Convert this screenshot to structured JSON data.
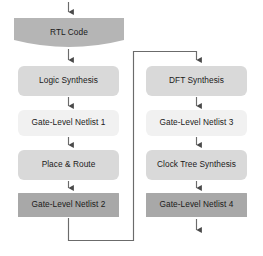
{
  "diagram": {
    "background_color": "#ffffff",
    "line_color": "#595959",
    "text_color": "#1a1a1a",
    "colors": {
      "banner_gray": "#b5b5b5",
      "mid_gray": "#d7d7d7",
      "light_gray": "#efefef",
      "dark_gray": "#a8a8a8"
    },
    "nodes": [
      {
        "id": "rtl-code",
        "label": "RTL Code",
        "shape": "banner",
        "fill": "#b5b5b5",
        "x": 14,
        "y": 18,
        "w": 110,
        "h": 29
      },
      {
        "id": "logic-synthesis",
        "label": "Logic Synthesis",
        "shape": "rounded",
        "fill": "#d9d9d9",
        "x": 18,
        "y": 66,
        "w": 101,
        "h": 30
      },
      {
        "id": "gate-level-netlist-1",
        "label": "Gate-Level Netlist 1",
        "shape": "rounded",
        "fill": "#f1f1f1",
        "x": 18,
        "y": 110,
        "w": 101,
        "h": 26
      },
      {
        "id": "place-and-route",
        "label": "Place & Route",
        "shape": "rounded",
        "fill": "#d9d9d9",
        "x": 18,
        "y": 150,
        "w": 101,
        "h": 30
      },
      {
        "id": "gate-level-netlist-2",
        "label": "Gate-Level Netlist 2",
        "shape": "square",
        "fill": "#a8a8a8",
        "x": 18,
        "y": 193,
        "w": 101,
        "h": 24
      },
      {
        "id": "dft-synthesis",
        "label": "DFT Synthesis",
        "shape": "rounded",
        "fill": "#d9d9d9",
        "x": 146,
        "y": 66,
        "w": 101,
        "h": 30
      },
      {
        "id": "gate-level-netlist-3",
        "label": "Gate-Level Netlist 3",
        "shape": "rounded",
        "fill": "#f1f1f1",
        "x": 146,
        "y": 110,
        "w": 101,
        "h": 26
      },
      {
        "id": "clock-tree-synthesis",
        "label": "Clock Tree Synthesis",
        "shape": "rounded",
        "fill": "#d9d9d9",
        "x": 146,
        "y": 150,
        "w": 101,
        "h": 30
      },
      {
        "id": "gate-level-netlist-4",
        "label": "Gate-Level Netlist 4",
        "shape": "square",
        "fill": "#a8a8a8",
        "x": 146,
        "y": 193,
        "w": 101,
        "h": 24
      }
    ],
    "edges": [
      {
        "id": "entry-to-rtl",
        "from": "",
        "to": "rtl-code",
        "kind": "arrow-down"
      },
      {
        "id": "rtl-to-logic",
        "from": "rtl-code",
        "to": "logic-synthesis",
        "kind": "arrow-down"
      },
      {
        "id": "logic-to-netlist1",
        "from": "logic-synthesis",
        "to": "gate-level-netlist-1",
        "kind": "arrow-down"
      },
      {
        "id": "netlist1-to-pnr",
        "from": "gate-level-netlist-1",
        "to": "place-and-route",
        "kind": "arrow-down"
      },
      {
        "id": "pnr-to-netlist2",
        "from": "place-and-route",
        "to": "gate-level-netlist-2",
        "kind": "arrow-down"
      },
      {
        "id": "feedback-to-dft",
        "from": "gate-level-netlist-2",
        "to": "dft-synthesis",
        "kind": "elbow-right-up"
      },
      {
        "id": "dft-to-netlist3",
        "from": "dft-synthesis",
        "to": "gate-level-netlist-3",
        "kind": "arrow-down"
      },
      {
        "id": "netlist3-to-cts",
        "from": "gate-level-netlist-3",
        "to": "clock-tree-synthesis",
        "kind": "arrow-down"
      },
      {
        "id": "cts-to-netlist4",
        "from": "clock-tree-synthesis",
        "to": "gate-level-netlist-4",
        "kind": "arrow-down"
      },
      {
        "id": "netlist4-to-exit",
        "from": "gate-level-netlist-4",
        "to": "",
        "kind": "arrow-down"
      }
    ]
  }
}
